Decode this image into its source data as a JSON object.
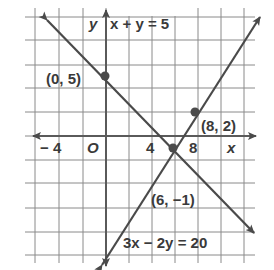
{
  "chart_data": {
    "type": "line",
    "title": "",
    "xlabel": "x",
    "ylabel": "y",
    "origin_label": "O",
    "grid": true,
    "grid_step": 2,
    "xlim": [
      -7,
      13
    ],
    "ylim": [
      -11,
      10
    ],
    "x_tick_labels": [
      {
        "value": -4,
        "label": "− 4"
      },
      {
        "value": 4,
        "label": "4"
      },
      {
        "value": 8,
        "label": "8"
      }
    ],
    "series": [
      {
        "name": "x + y = 5",
        "equation": "x + y = 5",
        "label": "x + y = 5",
        "slope": -1,
        "intercept": 5,
        "x_range": [
          -5,
          13
        ]
      },
      {
        "name": "3x − 2y = 20",
        "equation": "3x − 2y = 20",
        "label": "3x − 2y = 20",
        "slope": 1.5,
        "intercept": -10,
        "x_range": [
          0,
          13.5
        ]
      }
    ],
    "points": [
      {
        "x": 0,
        "y": 5,
        "label": "(0, 5)"
      },
      {
        "x": 8,
        "y": 2,
        "label": "(8, 2)"
      },
      {
        "x": 6,
        "y": -1,
        "label": "(6, −1)"
      }
    ]
  },
  "labels": {
    "y_axis": "y",
    "x_axis": "x",
    "origin": "O",
    "tick_neg4": "− 4",
    "tick_4": "4",
    "tick_8": "8",
    "eq1": "x + y = 5",
    "eq2": "3x − 2y = 20",
    "pt_0_5": "(0, 5)",
    "pt_8_2": "(8, 2)",
    "pt_6_neg1": "(6, −1)"
  },
  "colors": {
    "grid": "#8a8a8a",
    "axis": "#5a5a5a",
    "line": "#4a4a4a",
    "text": "#3a3a3a",
    "background": "#ffffff"
  }
}
